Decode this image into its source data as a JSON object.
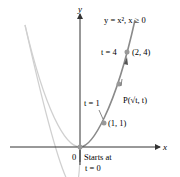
{
  "diagram": {
    "axis_labels": {
      "x": "x",
      "y": "y"
    },
    "origin_label": "0",
    "curve_label": "y = x², x ≥ 0",
    "points": [
      {
        "t_label": "t = 1",
        "coord_label": "(1, 1)"
      },
      {
        "t_label": "t = 4",
        "coord_label": "(2, 4)"
      }
    ],
    "param_point_label": "P(√t, t)",
    "start_label_line1": "Starts at",
    "start_label_line2": "t = 0",
    "colors": {
      "axis": "#333333",
      "curve_full": "#cccccc",
      "curve_path": "#7a7a7a",
      "points": "#999999"
    }
  }
}
